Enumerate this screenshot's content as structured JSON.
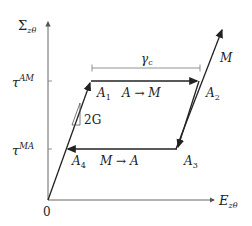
{
  "diagram": {
    "type": "stress-strain hysteresis (pseudoelastic loop)",
    "axes": {
      "y_label": "Σ",
      "y_label_sub": "zθ",
      "x_label": "E",
      "x_label_sub": "zθ",
      "origin_label": "0"
    },
    "ticks": {
      "upper": {
        "base": "τ",
        "sup": "AM"
      },
      "lower": {
        "base": "τ",
        "sup": "MA"
      }
    },
    "points": {
      "A1": {
        "base": "A",
        "sub": "1"
      },
      "A2": {
        "base": "A",
        "sub": "2"
      },
      "A3": {
        "base": "A",
        "sub": "3"
      },
      "A4": {
        "base": "A",
        "sub": "4"
      }
    },
    "transitions": {
      "forward": "A → M",
      "reverse": "M → A"
    },
    "slope_label": "2G",
    "plateau_width_label": "γ",
    "plateau_width_sub": "c",
    "branch_label": "M",
    "colors": {
      "axis": "#555555",
      "path": "#222222",
      "dimension": "#777777"
    }
  }
}
